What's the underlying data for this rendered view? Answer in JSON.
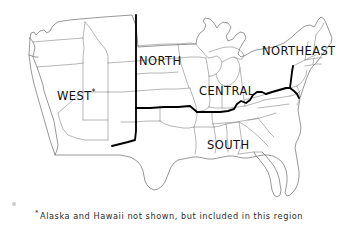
{
  "figure": {
    "type": "region-map",
    "background_color": "#ffffff",
    "state_border_color": "#8a8a8a",
    "region_border_color": "#000000",
    "text_color": "#111111"
  },
  "regions": [
    {
      "id": "west",
      "label": "WEST",
      "has_footnote_marker": true,
      "marker": "*"
    },
    {
      "id": "north",
      "label": "NORTH",
      "has_footnote_marker": false,
      "marker": ""
    },
    {
      "id": "central",
      "label": "CENTRAL",
      "has_footnote_marker": false,
      "marker": ""
    },
    {
      "id": "south",
      "label": "SOUTH",
      "has_footnote_marker": false,
      "marker": ""
    },
    {
      "id": "northeast",
      "label": "NORTHEAST",
      "has_footnote_marker": false,
      "marker": ""
    }
  ],
  "footnote": {
    "marker": "*",
    "text": "Alaska and Hawaii not shown, but included in this region"
  }
}
